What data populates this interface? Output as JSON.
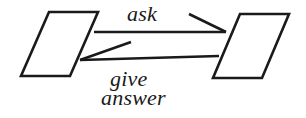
{
  "diagram": {
    "background_color": "#ffffff",
    "stroke_color": "#1a1a1a",
    "nodes": [
      {
        "id": "left-box",
        "name": "left-parallelogram",
        "shape": "parallelogram",
        "label": "",
        "points": "49,12 98,12 70,76 21,76"
      },
      {
        "id": "right-box",
        "name": "right-parallelogram",
        "shape": "parallelogram",
        "label": "",
        "points": "240,14 289,14 262,78 213,78"
      }
    ],
    "connectors": [
      {
        "id": "ask-arrow",
        "name": "ask-connector",
        "label": "ask",
        "from": "left-box",
        "to": "right-box",
        "direction": "left-to-right",
        "line": "94,32 226,32",
        "barb": "189,14 226,32"
      },
      {
        "id": "give-answer-arrow",
        "name": "give-answer-connector",
        "label_line_1": "give",
        "label_line_2": "answer",
        "from": "right-box",
        "to": "left-box",
        "direction": "right-to-left",
        "line": "80,60 219,56",
        "barb": "80,60 131,42"
      }
    ],
    "labels": {
      "ask": "ask",
      "give": "give",
      "answer": "answer"
    }
  }
}
